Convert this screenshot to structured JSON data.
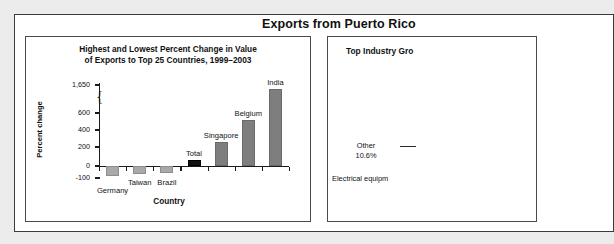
{
  "report": {
    "title": "Exports from Puerto Rico"
  },
  "left_panel": {
    "title_line1": "Highest and Lowest Percent Change in Value",
    "title_line2": "of Exports to Top 25 Countries, 1999–2003"
  },
  "right_panel": {
    "title": "Top Industry Gro",
    "label_other_name": "Other",
    "label_other_value": "10.6%",
    "label_electrical": "Electrical equipm"
  },
  "chart_data": {
    "type": "bar",
    "title": "Highest and Lowest Percent Change in Value of Exports to Top 25 Countries, 1999–2003",
    "xlabel": "Country",
    "ylabel": "Percent change",
    "grid": false,
    "legend": "none",
    "axis_break": {
      "between": [
        600,
        1650
      ],
      "symbol": "brace"
    },
    "ylim": [
      -100,
      1650
    ],
    "yticks": [
      -100,
      0,
      200,
      400,
      600,
      1650
    ],
    "ytick_labels": [
      "-100",
      "0",
      "200",
      "400",
      "600",
      "1,650"
    ],
    "categories": [
      "Germany",
      "Taiwan",
      "Brazil",
      "Total",
      "Singapore",
      "Belgium",
      "India"
    ],
    "values": [
      -85,
      -70,
      -55,
      65,
      275,
      525,
      1500
    ],
    "bar_styles": [
      "negative",
      "negative",
      "negative",
      "total",
      "positive",
      "positive",
      "positive"
    ],
    "colors": {
      "positive": "#7e7e7e",
      "negative": "#a9a9a9",
      "total": "#111111"
    }
  }
}
